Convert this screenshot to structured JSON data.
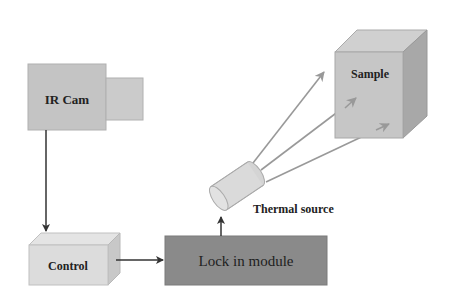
{
  "diagram": {
    "nodes": {
      "ir_cam": {
        "label": "IR Cam",
        "fill": "#c4c4c4"
      },
      "control": {
        "label": "Control",
        "fill": "#dcdcdc"
      },
      "lock_in": {
        "label": "Lock in module",
        "fill": "#8a8a8a"
      },
      "thermal_source": {
        "label": "Thermal source",
        "fill": "#d8d8d8"
      },
      "sample": {
        "label": "Sample",
        "fill": "#c8c8c8"
      }
    },
    "edges": [
      {
        "from": "IR Cam",
        "to": "Control"
      },
      {
        "from": "Control",
        "to": "Lock in module"
      },
      {
        "from": "Lock in module",
        "to": "Thermal source"
      },
      {
        "from": "Thermal source",
        "to": "Sample"
      },
      {
        "from": "Thermal source",
        "to": "Sample"
      },
      {
        "from": "Thermal source",
        "to": "Sample"
      }
    ],
    "colors": {
      "arrow_dark": "#333333",
      "arrow_light": "#999999"
    }
  }
}
